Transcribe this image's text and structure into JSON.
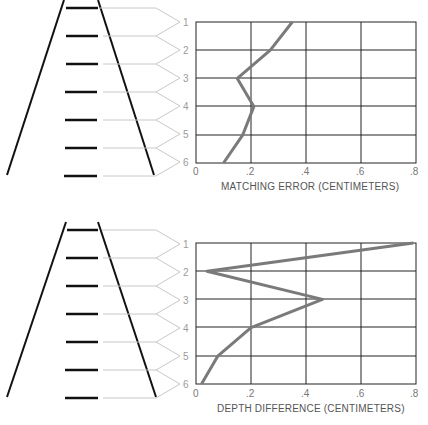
{
  "chart_data": [
    {
      "type": "line",
      "orientation": "horizontal-values-vertical-categories",
      "title": "",
      "xlabel": "MATCHING ERROR (CENTIMETERS)",
      "ylabel": "",
      "categories": [
        "1",
        "2",
        "3",
        "4",
        "5",
        "6"
      ],
      "values": [
        0.35,
        0.27,
        0.15,
        0.21,
        0.17,
        0.1
      ],
      "x_ticks": [
        "0",
        ".2",
        ".4",
        ".6",
        ".8"
      ],
      "xlim": [
        0,
        0.8
      ],
      "grid": true,
      "legend": null
    },
    {
      "type": "line",
      "orientation": "horizontal-values-vertical-categories",
      "title": "",
      "xlabel": "DEPTH DIFFERENCE (CENTIMETERS)",
      "ylabel": "",
      "categories": [
        "1",
        "2",
        "3",
        "4",
        "5",
        "6"
      ],
      "values": [
        0.79,
        0.04,
        0.46,
        0.2,
        0.08,
        0.02
      ],
      "x_ticks": [
        "0",
        ".2",
        ".4",
        ".6",
        ".8"
      ],
      "xlim": [
        0,
        0.8
      ],
      "grid": true,
      "legend": null
    }
  ],
  "panels": [
    {
      "row_labels": [
        "1",
        "2",
        "3",
        "4",
        "5",
        "6"
      ],
      "x_ticks": [
        "0",
        ".2",
        ".4",
        ".6",
        ".8"
      ],
      "axis_title": "MATCHING ERROR (CENTIMETERS)"
    },
    {
      "row_labels": [
        "1",
        "2",
        "3",
        "4",
        "5",
        "6"
      ],
      "x_ticks": [
        "0",
        ".2",
        ".4",
        ".6",
        ".8"
      ],
      "axis_title": "DEPTH DIFFERENCE (CENTIMETERS)"
    }
  ],
  "colors": {
    "ladder": "#111111",
    "connector": "#c8c8c8",
    "grid": "#222222",
    "series": "#7a7a7a",
    "labels": "#9a9a9a"
  }
}
